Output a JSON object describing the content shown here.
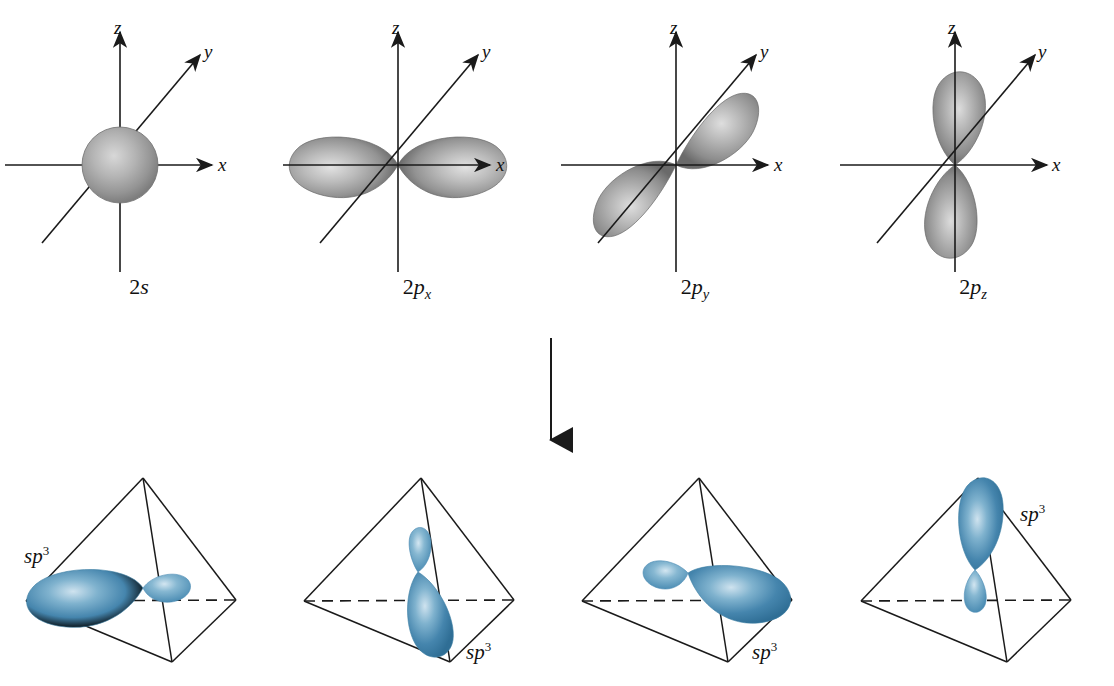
{
  "figure": {
    "background": "#ffffff",
    "atomic_orbital_color": "#8c8c8c",
    "hybrid_orbital_color": "#3d7ea6",
    "line_color": "#1a1a1a"
  },
  "axes": {
    "x_label": "x",
    "y_label": "y",
    "z_label": "z"
  },
  "atomic_orbitals": [
    {
      "id": "2s",
      "name_prefix": "2",
      "name_italic": "s",
      "name_sub": "",
      "shape": "sphere",
      "description": "spherical 2s orbital centered at origin"
    },
    {
      "id": "2px",
      "name_prefix": "2",
      "name_italic": "p",
      "name_sub": "x",
      "shape": "dumbbell-horizontal",
      "description": "two lobes along the x axis"
    },
    {
      "id": "2py",
      "name_prefix": "2",
      "name_italic": "p",
      "name_sub": "y",
      "shape": "dumbbell-diagonal",
      "description": "two lobes along the y axis pointing out of the page"
    },
    {
      "id": "2pz",
      "name_prefix": "2",
      "name_italic": "p",
      "name_sub": "z",
      "shape": "dumbbell-vertical",
      "description": "two lobes along the z axis"
    }
  ],
  "transition": {
    "label": "混成",
    "arrow_direction": "down"
  },
  "hybrid_orbitals": [
    {
      "id": "sp3-1",
      "name_italic": "sp",
      "name_sup": "3",
      "label_position": "left",
      "lobe_direction": "left",
      "description": "sp3 hybrid orbital directed toward the left rear vertex of the tetrahedron"
    },
    {
      "id": "sp3-2",
      "name_italic": "sp",
      "name_sup": "3",
      "label_position": "bottom-right",
      "lobe_direction": "down-front",
      "description": "sp3 hybrid orbital directed toward the front bottom vertex of the tetrahedron"
    },
    {
      "id": "sp3-3",
      "name_italic": "sp",
      "name_sup": "3",
      "label_position": "bottom-right",
      "lobe_direction": "right",
      "description": "sp3 hybrid orbital directed toward the right rear vertex of the tetrahedron"
    },
    {
      "id": "sp3-4",
      "name_italic": "sp",
      "name_sup": "3",
      "label_position": "top-right",
      "lobe_direction": "up",
      "description": "sp3 hybrid orbital directed toward the top apex of the tetrahedron"
    }
  ]
}
